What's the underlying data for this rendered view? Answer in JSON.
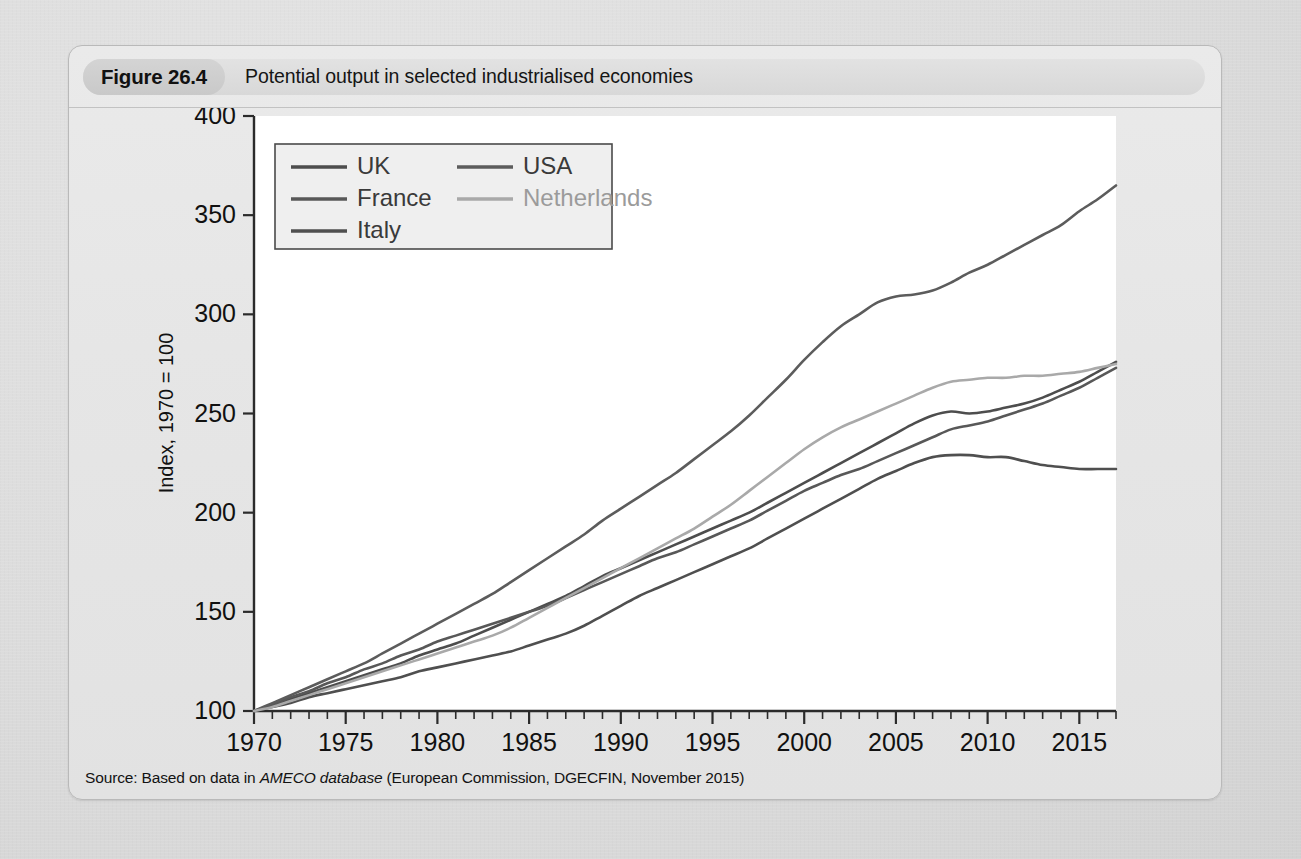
{
  "figure": {
    "number_label": "Figure 26.4",
    "caption": "Potential output in selected industrialised economies",
    "source_prefix": "Source: Based on data in ",
    "source_italic": "AMECO database",
    "source_suffix": " (European Commission, DGECFIN, November 2015)"
  },
  "colors": {
    "page_background": "#dcdcdc",
    "figure_background": "#e6e6e6",
    "caption_pill": "#cacaca",
    "caption_strip": "#dedede",
    "plot_background": "#ffffff",
    "axis": "#2b2b2b",
    "text": "#111111",
    "series_dark": "#4a4a4a",
    "series_mid": "#5e5e5e",
    "series_light": "#a8a8a8"
  },
  "chart_data": {
    "type": "line",
    "title": "Potential output in selected industrialised economies",
    "xlabel": "",
    "ylabel": "Index, 1970 = 100",
    "xlim": [
      1970,
      2017
    ],
    "ylim": [
      100,
      400
    ],
    "yticks": [
      100,
      150,
      200,
      250,
      300,
      350,
      400
    ],
    "xticks": [
      1970,
      1975,
      1980,
      1985,
      1990,
      1995,
      2000,
      2005,
      2010,
      2015
    ],
    "xtick_minor_step": 1,
    "grid": false,
    "legend_position": "upper-left-inside",
    "x": [
      1970,
      1971,
      1972,
      1973,
      1974,
      1975,
      1976,
      1977,
      1978,
      1979,
      1980,
      1981,
      1982,
      1983,
      1984,
      1985,
      1986,
      1987,
      1988,
      1989,
      1990,
      1991,
      1992,
      1993,
      1994,
      1995,
      1996,
      1997,
      1998,
      1999,
      2000,
      2001,
      2002,
      2003,
      2004,
      2005,
      2006,
      2007,
      2008,
      2009,
      2010,
      2011,
      2012,
      2013,
      2014,
      2015,
      2016,
      2017
    ],
    "series": [
      {
        "name": "UK",
        "color": "#4d4d4d",
        "values": [
          100,
          103,
          106,
          109,
          112,
          115,
          118,
          121,
          124,
          128,
          131,
          134,
          138,
          142,
          146,
          150,
          154,
          158,
          163,
          168,
          172,
          176,
          180,
          184,
          188,
          192,
          196,
          200,
          205,
          210,
          215,
          220,
          225,
          230,
          235,
          240,
          245,
          249,
          251,
          250,
          251,
          253,
          255,
          258,
          262,
          266,
          271,
          276
        ]
      },
      {
        "name": "France",
        "color": "#585858",
        "values": [
          100,
          103,
          107,
          110,
          114,
          117,
          121,
          124,
          128,
          131,
          135,
          138,
          141,
          144,
          147,
          150,
          153,
          157,
          161,
          165,
          169,
          173,
          177,
          180,
          184,
          188,
          192,
          196,
          201,
          206,
          211,
          215,
          219,
          222,
          226,
          230,
          234,
          238,
          242,
          244,
          246,
          249,
          252,
          255,
          259,
          263,
          268,
          273
        ]
      },
      {
        "name": "Italy",
        "color": "#4f4f4f",
        "values": [
          100,
          102,
          104,
          107,
          109,
          111,
          113,
          115,
          117,
          120,
          122,
          124,
          126,
          128,
          130,
          133,
          136,
          139,
          143,
          148,
          153,
          158,
          162,
          166,
          170,
          174,
          178,
          182,
          187,
          192,
          197,
          202,
          207,
          212,
          217,
          221,
          225,
          228,
          229,
          229,
          228,
          228,
          226,
          224,
          223,
          222,
          222,
          222
        ]
      },
      {
        "name": "USA",
        "color": "#5c5c5c",
        "values": [
          100,
          104,
          108,
          112,
          116,
          120,
          124,
          129,
          134,
          139,
          144,
          149,
          154,
          159,
          165,
          171,
          177,
          183,
          189,
          196,
          202,
          208,
          214,
          220,
          227,
          234,
          241,
          249,
          258,
          267,
          277,
          286,
          294,
          300,
          306,
          309,
          310,
          312,
          316,
          321,
          325,
          330,
          335,
          340,
          345,
          352,
          358,
          365
        ]
      },
      {
        "name": "Netherlands",
        "color": "#a9a9a9",
        "values": [
          100,
          102,
          105,
          108,
          111,
          114,
          117,
          120,
          123,
          126,
          129,
          132,
          135,
          138,
          142,
          147,
          152,
          157,
          162,
          167,
          172,
          177,
          182,
          187,
          192,
          198,
          204,
          211,
          218,
          225,
          232,
          238,
          243,
          247,
          251,
          255,
          259,
          263,
          266,
          267,
          268,
          268,
          269,
          269,
          270,
          271,
          273,
          275
        ]
      }
    ]
  }
}
